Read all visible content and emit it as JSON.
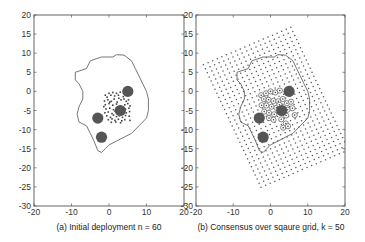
{
  "chart_data": [
    {
      "type": "scatter",
      "panel": "a",
      "caption": "(a) Initial deployment n = 60",
      "xlim": [
        -20,
        20
      ],
      "ylim": [
        -30,
        20
      ],
      "xticks": [
        -20,
        -10,
        0,
        10,
        20
      ],
      "yticks": [
        20,
        15,
        10,
        5,
        0,
        -5,
        -10,
        -15,
        -20,
        -25,
        -30
      ],
      "grid": false,
      "boundary": [
        [
          -9,
          5
        ],
        [
          -6,
          6
        ],
        [
          -5,
          8
        ],
        [
          -2,
          9
        ],
        [
          1,
          9
        ],
        [
          2,
          9.6
        ],
        [
          4,
          9.5
        ],
        [
          6,
          8
        ],
        [
          7,
          6
        ],
        [
          8,
          4
        ],
        [
          9,
          2
        ],
        [
          10,
          0
        ],
        [
          10.5,
          -2
        ],
        [
          10.5,
          -5
        ],
        [
          10,
          -7
        ],
        [
          8,
          -9
        ],
        [
          6,
          -11
        ],
        [
          4,
          -12
        ],
        [
          2,
          -13
        ],
        [
          0,
          -14
        ],
        [
          -1,
          -15
        ],
        [
          -2,
          -16
        ],
        [
          -3,
          -15.5
        ],
        [
          -4,
          -13
        ],
        [
          -5,
          -11
        ],
        [
          -6,
          -9
        ],
        [
          -8,
          -8
        ],
        [
          -8.5,
          -6
        ],
        [
          -8,
          -4
        ],
        [
          -7,
          -2
        ],
        [
          -7,
          0
        ],
        [
          -8,
          2
        ],
        [
          -9,
          3
        ],
        [
          -9,
          5
        ]
      ],
      "disks": [
        [
          5,
          0
        ],
        [
          3,
          -5
        ],
        [
          -3,
          -7
        ],
        [
          -2,
          -12
        ]
      ],
      "disk_radius": 1.5,
      "agents_count": 60,
      "agents": [
        [
          -1,
          -1
        ],
        [
          -0.5,
          -1.5
        ],
        [
          0,
          -0.5
        ],
        [
          0.5,
          -1
        ],
        [
          1,
          -0.3
        ],
        [
          1.5,
          -1.2
        ],
        [
          2,
          -0.5
        ],
        [
          2.5,
          -1
        ],
        [
          3,
          -0.2
        ],
        [
          -1.2,
          -2.5
        ],
        [
          -0.3,
          -2.2
        ],
        [
          0.6,
          -2.6
        ],
        [
          1.4,
          -2
        ],
        [
          2.2,
          -2.8
        ],
        [
          3.2,
          -2.2
        ],
        [
          4,
          -2
        ],
        [
          4.6,
          -2.6
        ],
        [
          5.2,
          -2.2
        ],
        [
          -1,
          -3.5
        ],
        [
          0,
          -3.2
        ],
        [
          1,
          -3.6
        ],
        [
          2,
          -3.3
        ],
        [
          3,
          -3.8
        ],
        [
          4.2,
          -3.5
        ],
        [
          5,
          -3.2
        ],
        [
          5.6,
          -3.8
        ],
        [
          -0.8,
          -4.6
        ],
        [
          0.2,
          -4.4
        ],
        [
          1.2,
          -4.8
        ],
        [
          2,
          -4.3
        ],
        [
          4.4,
          -4.6
        ],
        [
          5.3,
          -4.4
        ],
        [
          -1.1,
          -5.6
        ],
        [
          -0.2,
          -5.4
        ],
        [
          0.8,
          -5.8
        ],
        [
          1.6,
          -5.2
        ],
        [
          4.6,
          -5.6
        ],
        [
          5.5,
          -5.3
        ],
        [
          -0.6,
          -6.4
        ],
        [
          0.4,
          -6.8
        ],
        [
          1.2,
          -6.2
        ],
        [
          2,
          -6.6
        ],
        [
          2.8,
          -6.4
        ],
        [
          3.6,
          -6.8
        ],
        [
          4.4,
          -6.3
        ],
        [
          5.4,
          -6.5
        ],
        [
          -0.2,
          -7.4
        ],
        [
          0.8,
          -7.2
        ],
        [
          1.6,
          -7.6
        ],
        [
          2.5,
          -7.3
        ],
        [
          3.4,
          -7.7
        ],
        [
          4.2,
          -7.4
        ],
        [
          5.6,
          -7.6
        ],
        [
          0.2,
          -2.8
        ],
        [
          2.6,
          -1.8
        ],
        [
          -1.4,
          -4
        ],
        [
          3.8,
          -1.4
        ],
        [
          1.8,
          -8
        ],
        [
          0.6,
          -8.1
        ],
        [
          3.1,
          -8.2
        ]
      ]
    },
    {
      "type": "scatter",
      "panel": "b",
      "caption": "(b) Consensus over sqaure grid, k = 50",
      "xlim": [
        -20,
        20
      ],
      "ylim": [
        -30,
        20
      ],
      "xticks": [
        -20,
        -10,
        0,
        10,
        20
      ],
      "yticks": [
        20,
        15,
        10,
        5,
        0,
        -5,
        -10,
        -15,
        -20,
        -25,
        -30
      ],
      "grid": false,
      "square_grid": {
        "k": 50,
        "origin": [
          -18,
          7
        ],
        "u_vector": [
          1.236,
          0.515
        ],
        "v_vector": [
          0.515,
          -1.07
        ],
        "u_count": 20,
        "v_count": 31
      },
      "boundary": [
        [
          -9,
          5
        ],
        [
          -6,
          6
        ],
        [
          -5,
          8
        ],
        [
          -2,
          9
        ],
        [
          1,
          9
        ],
        [
          2,
          9.6
        ],
        [
          4,
          9.5
        ],
        [
          6,
          8
        ],
        [
          7,
          6
        ],
        [
          8,
          4
        ],
        [
          9,
          2
        ],
        [
          10,
          0
        ],
        [
          10.5,
          -2
        ],
        [
          10.5,
          -5
        ],
        [
          10,
          -7
        ],
        [
          8,
          -9
        ],
        [
          6,
          -11
        ],
        [
          4,
          -12
        ],
        [
          2,
          -13
        ],
        [
          0,
          -14
        ],
        [
          -1,
          -15
        ],
        [
          -2,
          -16
        ],
        [
          -3,
          -15.5
        ],
        [
          -4,
          -13
        ],
        [
          -5,
          -11
        ],
        [
          -6,
          -9
        ],
        [
          -8,
          -8
        ],
        [
          -8.5,
          -6
        ],
        [
          -8,
          -4
        ],
        [
          -7,
          -2
        ],
        [
          -7,
          0
        ],
        [
          -8,
          2
        ],
        [
          -9,
          3
        ],
        [
          -9,
          5
        ]
      ],
      "disks": [
        [
          5,
          0
        ],
        [
          3,
          -5
        ],
        [
          -3,
          -7
        ],
        [
          -2,
          -12
        ]
      ],
      "disk_radius": 1.5,
      "agents_final": [
        [
          -2.5,
          -1
        ],
        [
          -1.2,
          -0.5
        ],
        [
          0,
          0
        ],
        [
          1.3,
          -0.3
        ],
        [
          2.5,
          0.2
        ],
        [
          -1.8,
          -2
        ],
        [
          -0.5,
          -2.2
        ],
        [
          0.8,
          -2.5
        ],
        [
          2.1,
          -2.6
        ],
        [
          3.3,
          -2
        ],
        [
          -2.4,
          -3.6
        ],
        [
          -1.1,
          -3.7
        ],
        [
          0.3,
          -4
        ],
        [
          1.6,
          -4.3
        ],
        [
          4.4,
          -3.1
        ],
        [
          5.5,
          -2.7
        ],
        [
          -1.7,
          -5.3
        ],
        [
          -0.4,
          -5.6
        ],
        [
          1,
          -6
        ],
        [
          4.6,
          -4.8
        ],
        [
          5.9,
          -4.4
        ],
        [
          -0.4,
          -7
        ],
        [
          0.8,
          -7.4
        ],
        [
          4.2,
          -6.3
        ],
        [
          6.5,
          -6.2
        ],
        [
          2.9,
          -7.3
        ],
        [
          4.1,
          -8.4
        ],
        [
          3.4,
          -9.5
        ],
        [
          4.7,
          -9.1
        ],
        [
          2.4,
          -3.5
        ]
      ]
    }
  ],
  "labels": {
    "panel_a_caption": "(a) Initial deployment n = 60",
    "panel_b_caption": "(b) Consensus over sqaure grid, k = 50"
  },
  "colors": {
    "axis": "#555555",
    "boundary": "#666666",
    "disk": "#555555",
    "agent": "#444444",
    "grid_dot": "#555555",
    "ring": "#666666"
  }
}
